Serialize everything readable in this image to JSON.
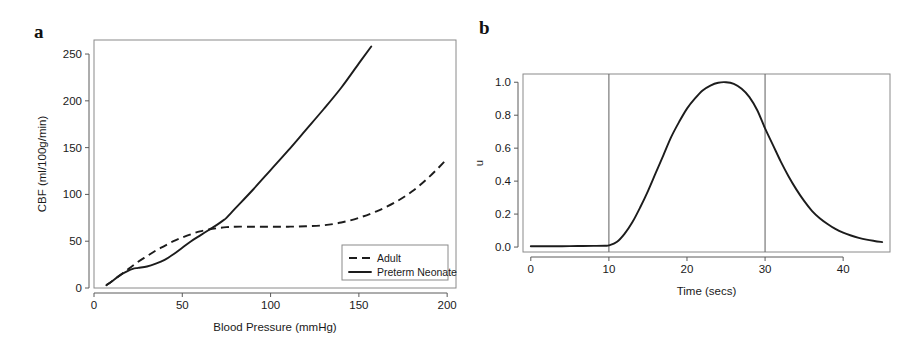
{
  "figure": {
    "panel_a_letter": "a",
    "panel_b_letter": "b"
  },
  "chart_data": [
    {
      "id": "panel-a",
      "type": "line",
      "title": "",
      "xlabel": "Blood Pressure (mmHg)",
      "ylabel": "CBF (ml/100g/min)",
      "xlim": [
        0,
        205
      ],
      "ylim": [
        0,
        265
      ],
      "xticks": [
        0,
        50,
        100,
        150,
        200
      ],
      "xticklabels": [
        "0",
        "50",
        "100",
        "150",
        "200"
      ],
      "yticks": [
        0,
        50,
        100,
        150,
        200,
        250
      ],
      "yticklabels": [
        "0",
        "50",
        "100",
        "150",
        "200",
        "250"
      ],
      "grid": false,
      "legend_position": "lower right",
      "series": [
        {
          "name": "Adult",
          "style": "dashed",
          "x": [
            7,
            10,
            15,
            20,
            25,
            30,
            35,
            40,
            45,
            50,
            55,
            60,
            65,
            70,
            75,
            80,
            90,
            100,
            110,
            120,
            130,
            140,
            150,
            160,
            170,
            180,
            190,
            200
          ],
          "y": [
            3,
            7,
            14,
            21,
            28,
            34,
            40,
            45,
            50,
            54,
            57.5,
            60.5,
            62.5,
            64,
            65,
            65.5,
            65.5,
            65.5,
            65.5,
            66,
            67,
            70,
            75,
            82,
            91,
            103,
            119,
            138
          ]
        },
        {
          "name": "Preterm Neonate",
          "style": "solid",
          "x": [
            7,
            10,
            15,
            20,
            22,
            25,
            30,
            35,
            40,
            45,
            50,
            55,
            60,
            65,
            70,
            73,
            75,
            80,
            90,
            100,
            110,
            120,
            130,
            140,
            150,
            157
          ],
          "y": [
            3,
            7,
            14,
            19,
            20.5,
            21.5,
            23,
            26,
            30,
            36,
            43,
            50,
            56,
            62,
            68,
            72,
            75,
            85,
            105,
            126,
            147,
            169,
            191,
            214,
            240,
            258
          ]
        }
      ],
      "legend": [
        {
          "label": "Adult",
          "style": "dashed"
        },
        {
          "label": "Preterm Neonate",
          "style": "solid"
        }
      ]
    },
    {
      "id": "panel-b",
      "type": "line",
      "title": "",
      "xlabel": "Time (secs)",
      "ylabel": "u",
      "xlim": [
        -1,
        46
      ],
      "ylim": [
        -0.03,
        1.05
      ],
      "xticks": [
        0,
        10,
        20,
        30,
        40
      ],
      "xticklabels": [
        "0",
        "10",
        "20",
        "30",
        "40"
      ],
      "yticks": [
        0.0,
        0.2,
        0.4,
        0.6,
        0.8,
        1.0
      ],
      "yticklabels": [
        "0.0",
        "0.2",
        "0.4",
        "0.6",
        "0.8",
        "1.0"
      ],
      "grid": false,
      "legend_position": "none",
      "vertical_lines": [
        10,
        30
      ],
      "series": [
        {
          "name": "u",
          "style": "solid",
          "x": [
            0,
            2,
            4,
            6,
            8,
            9.5,
            10,
            11,
            12,
            13,
            14,
            15,
            16,
            17,
            18,
            19,
            20,
            21,
            22,
            23,
            24,
            25,
            26,
            27,
            28,
            29,
            30,
            31,
            32,
            33,
            34,
            35,
            36,
            37,
            38,
            39,
            40,
            41,
            42,
            43,
            44,
            45
          ],
          "y": [
            0.005,
            0.005,
            0.005,
            0.006,
            0.007,
            0.008,
            0.01,
            0.03,
            0.08,
            0.15,
            0.24,
            0.34,
            0.45,
            0.56,
            0.67,
            0.76,
            0.84,
            0.9,
            0.95,
            0.98,
            0.997,
            1.0,
            0.99,
            0.96,
            0.91,
            0.83,
            0.72,
            0.62,
            0.52,
            0.43,
            0.35,
            0.28,
            0.22,
            0.175,
            0.14,
            0.11,
            0.087,
            0.07,
            0.056,
            0.045,
            0.037,
            0.03
          ]
        }
      ],
      "legend": []
    }
  ]
}
